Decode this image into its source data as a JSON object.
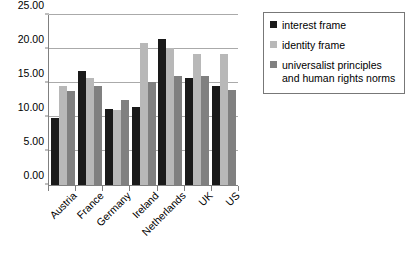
{
  "chart_data": {
    "type": "bar",
    "title": "",
    "subtitle": "",
    "xlabel": "",
    "ylabel": "",
    "ylim": [
      0,
      25
    ],
    "ytick_labels": [
      "0.00",
      "5.00",
      "10.00",
      "15.00",
      "20.00",
      "25.00"
    ],
    "ytick_values": [
      0,
      5,
      10,
      15,
      20,
      25
    ],
    "grid": true,
    "legend_position": "right",
    "categories": [
      "Austria",
      "France",
      "Germany",
      "Ireland",
      "Netherlands",
      "UK",
      "US"
    ],
    "series": [
      {
        "name": "interest frame",
        "color": "#1a1a1a",
        "values": [
          9.8,
          16.7,
          11.2,
          11.4,
          21.4,
          15.7,
          14.5
        ]
      },
      {
        "name": "identity frame",
        "color": "#b8b8b8",
        "values": [
          14.6,
          15.7,
          11.0,
          20.9,
          20.1,
          19.3,
          19.3
        ]
      },
      {
        "name": "universalist principles and human rights norms",
        "color": "#808080",
        "values": [
          13.8,
          14.5,
          12.5,
          15.1,
          16.0,
          16.0,
          13.9
        ]
      }
    ]
  },
  "legend": {
    "items": [
      {
        "label": "interest frame",
        "color": "#1a1a1a"
      },
      {
        "label": "identity frame",
        "color": "#b8b8b8"
      },
      {
        "label": "universalist principles and human rights norms",
        "color": "#808080"
      }
    ]
  },
  "colors": {
    "axis": "#808080",
    "grid": "#aaaaaa",
    "text": "#000000",
    "background": "#ffffff",
    "legend_border": "#777777"
  }
}
